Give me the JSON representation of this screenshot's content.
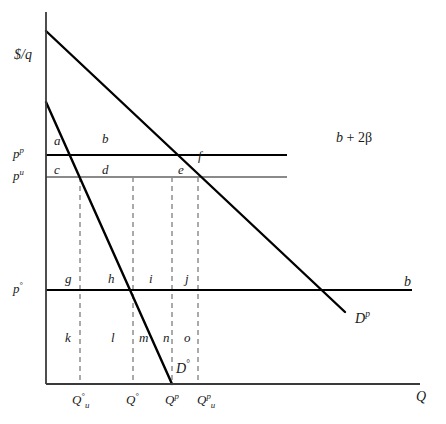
{
  "figure": {
    "type": "economics-supply-demand-diagram",
    "width": 446,
    "height": 424,
    "background_color": "#ffffff"
  },
  "axes": {
    "y_axis_label": "$/q",
    "x_axis_label": "Q",
    "y_axis_color": "#3a3a3a",
    "x_axis_color": "#3a3a3a",
    "origin_px": {
      "x": 46,
      "y": 384
    },
    "y_top_px": 12,
    "x_right_px": 420
  },
  "price_levels": [
    {
      "id": "p-p",
      "label_base": "p",
      "label_sup": "p",
      "y_px": 155,
      "line_color": "#000000",
      "line_width": 2.2,
      "x_end_px": 287
    },
    {
      "id": "p-u",
      "label_base": "p",
      "label_sup": "u",
      "y_px": 177,
      "line_color": "#8a8a8a",
      "line_width": 2.0,
      "x_end_px": 287
    },
    {
      "id": "p-o",
      "label_base": "p",
      "label_sup": "°",
      "y_px": 290,
      "line_color": "#000000",
      "line_width": 2.2,
      "x_end_px": 412
    }
  ],
  "quantity_ticks": [
    {
      "id": "q-o-u",
      "base": "Q",
      "sup": "°",
      "sub": "u",
      "x_px": 80
    },
    {
      "id": "q-o",
      "base": "Q",
      "sup": "°",
      "sub": "",
      "x_px": 133
    },
    {
      "id": "q-p",
      "base": "Q",
      "sup": "p",
      "sub": "",
      "x_px": 172
    },
    {
      "id": "q-p-u",
      "base": "Q",
      "sup": "p",
      "sub": "u",
      "x_px": 198
    }
  ],
  "dashed_lines": {
    "color": "#7d7d7d",
    "dash": "5,4",
    "width": 1.3,
    "x_positions": [
      80,
      133,
      172,
      198
    ],
    "y_top_px": 177,
    "y_bottom_px": 384
  },
  "demand_curves": [
    {
      "id": "demand-p",
      "label": "D",
      "label_sup": "p",
      "label_x_px": 355,
      "label_y_px": 316,
      "x1_px": 46,
      "y1_px": 31,
      "x2_px": 345,
      "y2_px": 312,
      "color": "#000000",
      "width": 2.4
    },
    {
      "id": "demand-o",
      "label": "D",
      "label_sup": "°",
      "label_x_px": 176,
      "label_y_px": 366,
      "x1_px": 46,
      "y1_px": 102,
      "x2_px": 172,
      "y2_px": 384,
      "color": "#000000",
      "width": 2.4
    }
  ],
  "curve_annotations": [
    {
      "id": "b-plus-2beta",
      "text": "b + 2β",
      "x_px": 336,
      "y_px": 138,
      "italic_part": "b",
      "plain_part": " + 2β"
    },
    {
      "id": "b-right",
      "text": "b",
      "x_px": 404,
      "y_px": 281
    }
  ],
  "region_labels_upper": [
    {
      "id": "region-a",
      "text": "a",
      "x_px": 54,
      "y_px": 134
    },
    {
      "id": "region-b",
      "text": "b",
      "x_px": 102,
      "y_px": 132
    },
    {
      "id": "region-c",
      "text": "c",
      "x_px": 54,
      "y_px": 166
    },
    {
      "id": "region-d",
      "text": "d",
      "x_px": 102,
      "y_px": 166
    },
    {
      "id": "region-e",
      "text": "e",
      "x_px": 178,
      "y_px": 166
    },
    {
      "id": "region-f",
      "text": "f",
      "x_px": 198,
      "y_px": 152
    }
  ],
  "region_labels_middle": [
    {
      "id": "region-g",
      "text": "g",
      "x_px": 65,
      "y_px": 275
    },
    {
      "id": "region-h",
      "text": "h",
      "x_px": 108,
      "y_px": 275
    },
    {
      "id": "region-i",
      "text": "i",
      "x_px": 148,
      "y_px": 275
    },
    {
      "id": "region-j",
      "text": "j",
      "x_px": 185,
      "y_px": 275
    }
  ],
  "region_labels_lower": [
    {
      "id": "region-k",
      "text": "k",
      "x_px": 65,
      "y_px": 336
    },
    {
      "id": "region-l",
      "text": "l",
      "x_px": 110,
      "y_px": 336
    },
    {
      "id": "region-m",
      "text": "m",
      "x_px": 140,
      "y_px": 336
    },
    {
      "id": "region-n",
      "text": "n",
      "x_px": 163,
      "y_px": 336
    },
    {
      "id": "region-o",
      "text": "o",
      "x_px": 184,
      "y_px": 336
    }
  ]
}
